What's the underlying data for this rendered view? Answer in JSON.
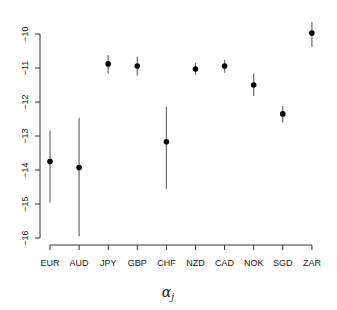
{
  "chart_data": {
    "type": "scatter",
    "subtype": "point_with_error_bars",
    "title": "",
    "xlabel": "α_j",
    "xlabel_main": "α",
    "xlabel_sub": "j",
    "ylabel": "",
    "categories": [
      "EUR",
      "AUD",
      "JPY",
      "GBP",
      "CHF",
      "NZD",
      "CAD",
      "NOK",
      "SGD",
      "ZAR"
    ],
    "values": [
      -13.75,
      -13.93,
      -10.88,
      -10.94,
      -13.17,
      -11.03,
      -10.94,
      -11.5,
      -12.35,
      -9.97
    ],
    "upper": [
      -12.84,
      -12.46,
      -10.62,
      -10.67,
      -12.14,
      -10.85,
      -10.76,
      -11.17,
      -12.11,
      -9.65
    ],
    "lower": [
      -14.96,
      -15.95,
      -11.17,
      -11.23,
      -14.55,
      -11.2,
      -11.14,
      -11.82,
      -12.61,
      -10.38
    ],
    "ylim": [
      -16,
      -10
    ],
    "yticks": [
      -16,
      -15,
      -14,
      -13,
      -12,
      -11,
      -10
    ],
    "ytick_labels": [
      "−16",
      "−15",
      "−14",
      "−13",
      "−12",
      "−11",
      "−10"
    ],
    "grid": false,
    "legend": null,
    "colors": {
      "point": "#000000",
      "error_bar": "#6e6e6e",
      "axis": "#333333"
    }
  }
}
